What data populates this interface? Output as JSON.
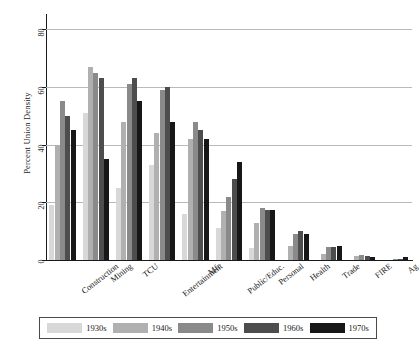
{
  "chart_data": {
    "type": "bar",
    "title": "",
    "subtitle": "",
    "xlabel": "",
    "ylabel": "Percent Union Density",
    "ylim": [
      0,
      85
    ],
    "yticks": [
      0,
      20,
      40,
      60,
      80
    ],
    "ytick_labels": [
      "0",
      "20",
      "40",
      "60",
      "80"
    ],
    "grid": "horizontal",
    "legend_position": "bottom",
    "categories": [
      "Construction",
      "Mining",
      "TCU",
      "Entertainment",
      "Mfr",
      "Public/Educ.",
      "Personal",
      "Health",
      "Trade",
      "FIRE",
      "Ag"
    ],
    "series": [
      {
        "name": "1930s",
        "color": "#d8d8d8",
        "values": [
          19,
          51,
          25,
          33,
          16,
          11,
          4,
          0,
          0,
          0,
          0
        ]
      },
      {
        "name": "1940s",
        "color": "#b0b0b0",
        "values": [
          40,
          67,
          48,
          44,
          42,
          17,
          13,
          5,
          2,
          1.5,
          0
        ]
      },
      {
        "name": "1950s",
        "color": "#8a8a8a",
        "values": [
          55,
          65,
          61,
          59,
          48,
          22,
          18,
          9,
          4.5,
          1.8,
          0.3
        ]
      },
      {
        "name": "1960s",
        "color": "#4d4d4d",
        "values": [
          50,
          63,
          63,
          60,
          45,
          28,
          17.5,
          10,
          4.5,
          1.5,
          0.5
        ]
      },
      {
        "name": "1970s",
        "color": "#171717",
        "values": [
          45,
          35,
          55,
          48,
          42,
          34,
          17.5,
          9,
          5,
          1,
          1.2
        ]
      }
    ]
  }
}
